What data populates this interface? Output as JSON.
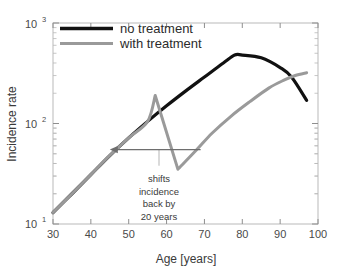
{
  "chart_data": {
    "type": "line",
    "title": "",
    "xlabel": "Age [years]",
    "ylabel": "Incidence rate",
    "xlim": [
      30,
      100
    ],
    "ylim": [
      10,
      1000
    ],
    "yscale": "log",
    "xscale": "linear",
    "grid": false,
    "legend_position": "top-left",
    "xticks": [
      30,
      40,
      50,
      60,
      70,
      80,
      90,
      100
    ],
    "xtick_labels": [
      "30",
      "40",
      "50",
      "60",
      "70",
      "80",
      "90",
      "100"
    ],
    "yticks": [
      10,
      100,
      1000
    ],
    "ytick_labels": [
      "10^1",
      "10^2",
      "10^3"
    ],
    "ytick_base": "10",
    "ytick_exponents": [
      "1",
      "2",
      "3"
    ],
    "series": [
      {
        "name": "no treatment",
        "color": "#111111",
        "width": 3.2,
        "x": [
          30,
          35,
          40,
          45,
          50,
          55,
          60,
          65,
          70,
          75,
          78,
          80,
          85,
          90,
          93,
          97
        ],
        "y": [
          13,
          20,
          31,
          48,
          72,
          105,
          150,
          210,
          290,
          400,
          480,
          480,
          450,
          360,
          290,
          170
        ]
      },
      {
        "name": "with treatment",
        "color": "#9a9a9a",
        "width": 3.0,
        "x": [
          30,
          35,
          40,
          45,
          50,
          55,
          57,
          63,
          68,
          72,
          77,
          82,
          87,
          91,
          94,
          97
        ],
        "y": [
          13,
          20,
          31,
          48,
          72,
          105,
          190,
          35,
          55,
          80,
          118,
          165,
          225,
          270,
          300,
          320
        ]
      }
    ],
    "annotations": [
      {
        "name": "shift-arrow",
        "type": "arrow",
        "direction": "left",
        "x_start": 69,
        "x_end": 45,
        "y": 55,
        "color": "#6e6e6e"
      },
      {
        "name": "leader-line",
        "type": "line",
        "x": 58,
        "y_top": 55,
        "y_bottom": 38,
        "color": "#b5b5b5"
      },
      {
        "name": "shift-caption",
        "type": "text",
        "lines": [
          "shifts",
          "incidence",
          "back by",
          "20 years"
        ],
        "x": 58,
        "y": 30,
        "color": "#3a3a3a"
      }
    ],
    "legend": [
      {
        "label": "no treatment",
        "color": "#111111"
      },
      {
        "label": "with treatment",
        "color": "#9a9a9a"
      }
    ]
  },
  "legend": {
    "items": [
      {
        "label": "no treatment"
      },
      {
        "label": "with treatment"
      }
    ]
  },
  "axes": {
    "xlabel": "Age [years]",
    "ylabel": "Incidence rate",
    "xticks": [
      "30",
      "40",
      "50",
      "60",
      "70",
      "80",
      "90",
      "100"
    ],
    "ybase": "10",
    "yexp_low": "1",
    "yexp_mid": "2",
    "yexp_high": "3"
  },
  "annotation": {
    "line1": "shifts",
    "line2": "incidence",
    "line3": "back by",
    "line4": "20 years"
  }
}
